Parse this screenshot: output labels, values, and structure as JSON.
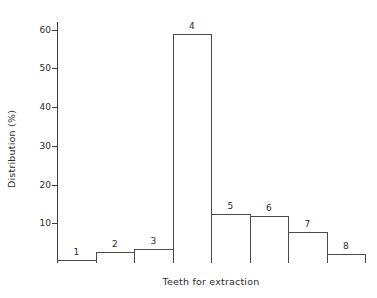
{
  "chart_data": {
    "type": "bar",
    "title": "",
    "xlabel": "Teeth for extraction",
    "ylabel": "Distribution (%)",
    "categories": [
      "1",
      "2",
      "3",
      "4",
      "5",
      "6",
      "7",
      "8"
    ],
    "values": [
      0.5,
      2.5,
      3.3,
      59.0,
      12.5,
      12.0,
      7.8,
      2.0
    ],
    "ylim": [
      0,
      62
    ],
    "yticks": [
      10,
      20,
      30,
      40,
      50,
      60
    ],
    "ytick_labels": [
      "10",
      "20",
      "30",
      "40",
      "50",
      "60"
    ],
    "xlim": [
      0,
      8
    ],
    "grid": false,
    "legend": null,
    "bar_style": {
      "facecolor": "#ffffff",
      "edgecolor": "#4a4a4a",
      "edge_width": 1,
      "adjacent": true
    },
    "bar_labels_position": "above-bar",
    "axis_color": "#3d3d3d",
    "background": "#ffffff",
    "text_color": "#2b2b2b"
  },
  "axes": {
    "y_title": "Distribution (%)",
    "x_title": "Teeth for extraction"
  }
}
